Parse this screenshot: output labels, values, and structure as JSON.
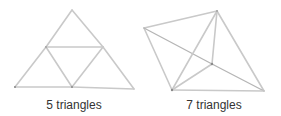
{
  "figures": [
    {
      "id": "flat-triangle",
      "caption": "5 triangles",
      "caption_x": 74,
      "vertices": {
        "apex": [
          72,
          10
        ],
        "mid_left": [
          46,
          47
        ],
        "mid_right": [
          103,
          47
        ],
        "bottom_left": [
          15,
          87
        ],
        "bottom_mid": [
          72,
          87
        ],
        "bottom_right": [
          134,
          89
        ]
      }
    },
    {
      "id": "tetrahedron-like",
      "caption": "7 triangles",
      "caption_x": 214,
      "vertices": {
        "left": [
          144,
          28
        ],
        "top": [
          217,
          11
        ],
        "center": [
          212,
          64
        ],
        "bottom_left": [
          172,
          90
        ],
        "bottom_right": [
          264,
          91
        ]
      }
    }
  ],
  "colors": {
    "stick": "#c9c9c9",
    "joint": "#8a8a8a",
    "text": "#333333",
    "background": "#ffffff"
  }
}
